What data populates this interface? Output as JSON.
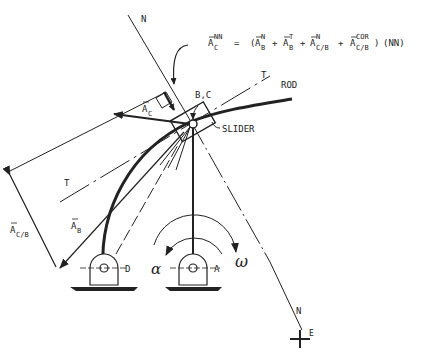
{
  "diagram": {
    "equation": {
      "lhs_base": "A",
      "lhs_sup": "NN",
      "lhs_sub": "C",
      "equals": "=",
      "open_paren": "(",
      "terms": [
        {
          "base": "A",
          "sup": "N",
          "sub": "B"
        },
        {
          "base": "A",
          "sup": "T",
          "sub": "B"
        },
        {
          "base": "A",
          "sup": "N",
          "sub": "C/B"
        },
        {
          "base": "A",
          "sup": "COR",
          "sub": "C/B"
        }
      ],
      "plus": "+",
      "close": ")",
      "suffix": "(NN)"
    },
    "labels": {
      "n_top": "N",
      "n_bottom": "N",
      "e_point": "E",
      "t_upper": "T",
      "t_lower": "T",
      "rod": "ROD",
      "slider": "SLIDER",
      "bc": "B,C",
      "ac": {
        "base": "A",
        "sub": "C"
      },
      "ab": {
        "base": "A",
        "sub": "B"
      },
      "acb": {
        "base": "A",
        "sub": "C/B"
      },
      "pivot_d": "D",
      "pivot_a": "A",
      "alpha": "α",
      "omega": "ω"
    },
    "colors": {
      "ink": "#222222",
      "background": "#ffffff"
    }
  }
}
